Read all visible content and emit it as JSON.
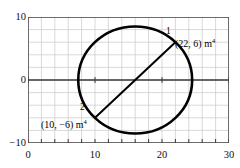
{
  "figure": {
    "kind": "mohrs-circle-diagram",
    "line_color": "#000000",
    "grid_color": "#c9c9c9",
    "axis_color": "#3a3a3a",
    "frame_color": "#555555"
  },
  "axes": {
    "x": {
      "min": 0,
      "max": 30,
      "tick_step": 2,
      "labeled_ticks": [
        {
          "value": 0,
          "label": "0"
        },
        {
          "value": 10,
          "label": "10"
        },
        {
          "value": 20,
          "label": "20"
        },
        {
          "value": 30,
          "label": "30"
        }
      ]
    },
    "y": {
      "min": -10,
      "max": 10,
      "tick_step": 2,
      "labeled_ticks": [
        {
          "value": 10,
          "label": "10"
        },
        {
          "value": 0,
          "label": "0"
        },
        {
          "value": -10,
          "label": "−10"
        }
      ]
    }
  },
  "chart_data": {
    "type": "scatter",
    "title": "",
    "xlabel": "",
    "ylabel": "",
    "xlim": [
      0,
      30
    ],
    "ylim": [
      -10,
      10
    ],
    "grid": true,
    "legend": "none",
    "shapes": [
      {
        "name": "mohrs-circle",
        "type": "circle",
        "center": [
          16,
          0
        ],
        "radius": 8.5,
        "stroke": "#000000",
        "stroke_width": 2.6,
        "fill": "none"
      },
      {
        "name": "diameter-line",
        "type": "line",
        "from": [
          10,
          -6
        ],
        "to": [
          22,
          6
        ],
        "stroke": "#000000",
        "stroke_width": 2.0
      }
    ],
    "points": [
      {
        "name": "point-1",
        "marker": "1",
        "x": 22,
        "y": 6,
        "label": "(22, 6) m",
        "label_sup": "4"
      },
      {
        "name": "point-2",
        "marker": "2",
        "x": 10,
        "y": -6,
        "label": "(10, −6) m",
        "label_sup": "4"
      }
    ]
  },
  "annotations": {
    "point1": {
      "number": "1",
      "coord_text": "(22, 6) m",
      "coord_sup": "4"
    },
    "point2": {
      "number": "2",
      "coord_text": "(10, −6) m",
      "coord_sup": "4"
    }
  }
}
